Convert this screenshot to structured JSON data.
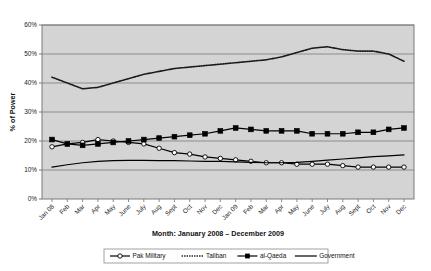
{
  "chart_data": {
    "type": "line",
    "title": "",
    "xlabel": "Month: January 2008 – December 2009",
    "ylabel": "% of Power",
    "ylim": [
      0,
      60
    ],
    "yticks": [
      0,
      10,
      20,
      30,
      40,
      50,
      60
    ],
    "ytick_labels": [
      "0%",
      "10%",
      "20%",
      "30%",
      "40%",
      "50%",
      "60%"
    ],
    "grid": true,
    "legend_position": "bottom",
    "categories": [
      "Jan 08",
      "Feb",
      "Mar",
      "Apr",
      "May",
      "June",
      "July",
      "Aug",
      "Sept",
      "Oct",
      "Nov",
      "Dec",
      "Jan 09",
      "Feb",
      "Mar",
      "Apr",
      "May",
      "June",
      "July",
      "Aug",
      "Sept",
      "Oct",
      "Nov",
      "Dec"
    ],
    "series": [
      {
        "name": "Pak Military",
        "marker": "open-circle",
        "style": "solid",
        "color": "#000000",
        "values": [
          18.0,
          19.0,
          19.5,
          20.5,
          20.0,
          19.5,
          19.0,
          17.5,
          16.0,
          15.5,
          14.5,
          14.0,
          13.5,
          13.0,
          12.5,
          12.5,
          12.0,
          12.0,
          12.0,
          11.5,
          11.0,
          11.0,
          11.0,
          11.0
        ]
      },
      {
        "name": "Taliban",
        "marker": "none",
        "style": "dotted",
        "color": "#1a1a1a",
        "values": [
          42.0,
          40.0,
          38.0,
          38.5,
          40.0,
          41.5,
          43.0,
          44.0,
          45.0,
          45.5,
          46.0,
          46.5,
          47.0,
          47.5,
          48.0,
          49.0,
          50.5,
          52.0,
          52.5,
          51.5,
          51.0,
          51.0,
          50.0,
          47.5
        ]
      },
      {
        "name": "al-Qaeda",
        "marker": "filled-square",
        "style": "solid",
        "color": "#000000",
        "values": [
          20.5,
          19.0,
          18.5,
          19.0,
          19.5,
          20.0,
          20.5,
          21.0,
          21.5,
          22.0,
          22.5,
          23.5,
          24.5,
          24.0,
          23.5,
          23.5,
          23.5,
          22.5,
          22.5,
          22.5,
          23.0,
          23.0,
          24.0,
          24.5
        ]
      },
      {
        "name": "Government",
        "marker": "none",
        "style": "solid",
        "color": "#000000",
        "values": [
          11.0,
          11.8,
          12.5,
          13.0,
          13.2,
          13.3,
          13.3,
          13.2,
          13.2,
          13.1,
          13.0,
          13.0,
          12.8,
          12.6,
          12.5,
          12.5,
          12.6,
          13.0,
          13.4,
          13.8,
          14.2,
          14.6,
          14.9,
          15.2
        ]
      }
    ]
  },
  "legend": {
    "entries": [
      {
        "label": "Pak Military",
        "marker": "open-circle",
        "style": "solid"
      },
      {
        "label": "Taliban",
        "marker": "none",
        "style": "dotted"
      },
      {
        "label": "al-Qaeda",
        "marker": "filled-square",
        "style": "solid"
      },
      {
        "label": "Government",
        "marker": "none",
        "style": "solid"
      }
    ]
  },
  "colors": {
    "plot_background": "#d4d4d4",
    "page_background": "#ffffff",
    "gridline": "#6e6e6e",
    "border": "#7a7a7a",
    "line": "#000000"
  }
}
